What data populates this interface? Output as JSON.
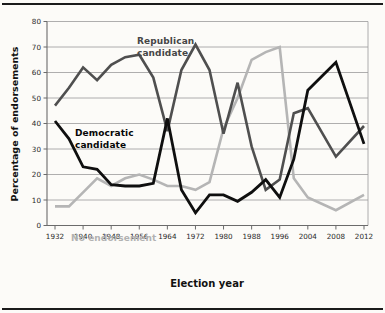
{
  "figure": {
    "background": "#fcfbf8",
    "rule_color": "#1b1b1b",
    "y_axis_title": "Percentage of endorsements",
    "x_axis_title": "Election year",
    "y_ticks": [
      0,
      10,
      20,
      30,
      40,
      50,
      60,
      70,
      80
    ],
    "x_tick_years": [
      1932,
      1940,
      1948,
      1956,
      1964,
      1972,
      1980,
      1988,
      1996,
      2004,
      2008,
      2012
    ],
    "gridline_color": "#9b9b9b",
    "axis_color": "#6b6b6b",
    "tick_label_color": "#2a2a2a"
  },
  "chart_data": {
    "type": "line",
    "title": "",
    "xlabel": "Election year",
    "ylabel": "Percentage of endorsements",
    "ylim": [
      0,
      80
    ],
    "grid": "horizontal",
    "legend_position": "inline-annotations",
    "x": [
      1932,
      1936,
      1940,
      1944,
      1948,
      1952,
      1956,
      1960,
      1964,
      1968,
      1972,
      1976,
      1980,
      1984,
      1988,
      1992,
      1996,
      2000,
      2004,
      2008,
      2012
    ],
    "series": [
      {
        "name": "No endorsement",
        "color": "#b5b5b5",
        "values": [
          7.5,
          7.5,
          13,
          18.5,
          15.5,
          18.5,
          20,
          18,
          15.5,
          15.5,
          14,
          17,
          38,
          50,
          65,
          68,
          70,
          18.5,
          11,
          6,
          12
        ]
      },
      {
        "name": "Republican candidate",
        "color": "#4f4f4f",
        "values": [
          47,
          54,
          62,
          57,
          63,
          66,
          67,
          58,
          37,
          61,
          71,
          61,
          36,
          56,
          31,
          14,
          18,
          44,
          46,
          27,
          39
        ]
      },
      {
        "name": "Democratic candidate",
        "color": "#0f0f0f",
        "values": [
          41,
          34,
          23,
          22,
          16,
          15.5,
          15.5,
          16.5,
          42,
          14,
          5,
          12,
          12,
          9.5,
          13,
          18,
          11,
          26,
          53,
          64,
          32
        ]
      }
    ],
    "annotations": {
      "republican": "Republican\ncandidate",
      "democratic": "Democratic\ncandidate",
      "none": "No endorsement"
    }
  }
}
